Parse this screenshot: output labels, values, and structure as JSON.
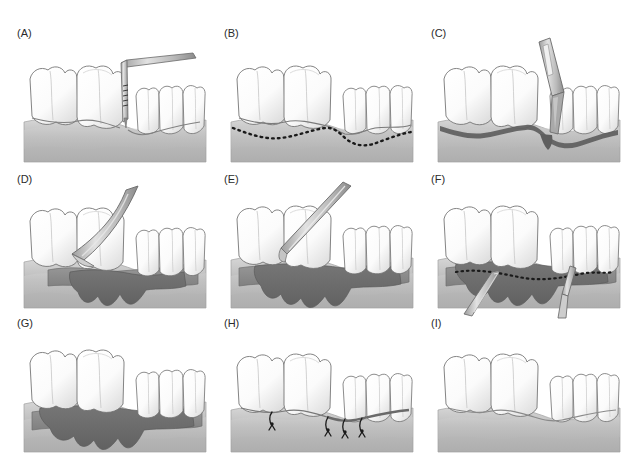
{
  "figure": {
    "panel_count": 9,
    "columns": 3,
    "rows": 3,
    "background_color": "#ffffff"
  },
  "palette": {
    "tooth_fill": "#fbfbfb",
    "tooth_shade": "#dcdcdc",
    "tooth_outline": "#6e6e6e",
    "gingiva_light": "#d6d6d6",
    "gingiva_mid": "#bcbcbc",
    "gingiva_dark": "#aeaeae",
    "bone_band": "#c8c8c8",
    "defect_dark": "#6d6d6d",
    "flap_mid": "#8d8d8d",
    "instrument_fill": "#b9b9b9",
    "instrument_shade": "#8a8a8a",
    "instrument_outline": "#6a6a6a",
    "incision_line": "#1a1a1a",
    "suture": "#1a1a1a",
    "label_color": "#2b2b2b"
  },
  "panels": [
    {
      "id": "A",
      "label": "(A)",
      "caption": "Periodontal probing of pocket depth",
      "instrument": "periodontal-probe",
      "instrument_label": "graduated periodontal probe",
      "features": [
        "graduated probe markings",
        "intact gingiva",
        "shallow sulcus outline"
      ],
      "col": 0,
      "row": 0
    },
    {
      "id": "B",
      "label": "(B)",
      "caption": "Planned internal bevel incision marked",
      "instrument": "none",
      "instrument_label": "",
      "features": [
        "dashed incision outline",
        "intact gingiva"
      ],
      "col": 1,
      "row": 0
    },
    {
      "id": "C",
      "label": "(C)",
      "caption": "Incision made with scalpel blade",
      "instrument": "scalpel",
      "instrument_label": "scalpel handle and blade",
      "features": [
        "dark incision line",
        "scalpel in vertical approach"
      ],
      "col": 2,
      "row": 0
    },
    {
      "id": "D",
      "label": "(D)",
      "caption": "Flap reflection with periosteal elevator",
      "instrument": "periosteal-elevator",
      "instrument_label": "periosteal elevator",
      "features": [
        "partially reflected flap",
        "exposed osseous defect"
      ],
      "col": 0,
      "row": 1
    },
    {
      "id": "E",
      "label": "(E)",
      "caption": "Granulation tissue debridement with curette",
      "instrument": "curette",
      "instrument_label": "surgical curette",
      "features": [
        "fully reflected flap",
        "angular bony defects exposed"
      ],
      "col": 1,
      "row": 1
    },
    {
      "id": "F",
      "label": "(F)",
      "caption": "Osseous recontouring along planned outline",
      "instrument": "double-curette",
      "instrument_label": "paired bone instruments",
      "features": [
        "dashed recontouring outline",
        "two instruments engaged"
      ],
      "col": 2,
      "row": 1
    },
    {
      "id": "G",
      "label": "(G)",
      "caption": "Debrided defect after instrumentation",
      "instrument": "none",
      "instrument_label": "",
      "features": [
        "clean osseous defect",
        "no instruments"
      ],
      "col": 0,
      "row": 2
    },
    {
      "id": "H",
      "label": "(H)",
      "caption": "Flap repositioned and sutured",
      "instrument": "sutures",
      "instrument_label": "interrupted sutures",
      "features": [
        "four interrupted sutures",
        "flap adapted to teeth"
      ],
      "suture_count": 4,
      "col": 1,
      "row": 2
    },
    {
      "id": "I",
      "label": "(I)",
      "caption": "Healed tissue after surgery",
      "instrument": "none",
      "instrument_label": "",
      "features": [
        "healed gingival contour",
        "no sutures"
      ],
      "col": 2,
      "row": 2
    }
  ]
}
